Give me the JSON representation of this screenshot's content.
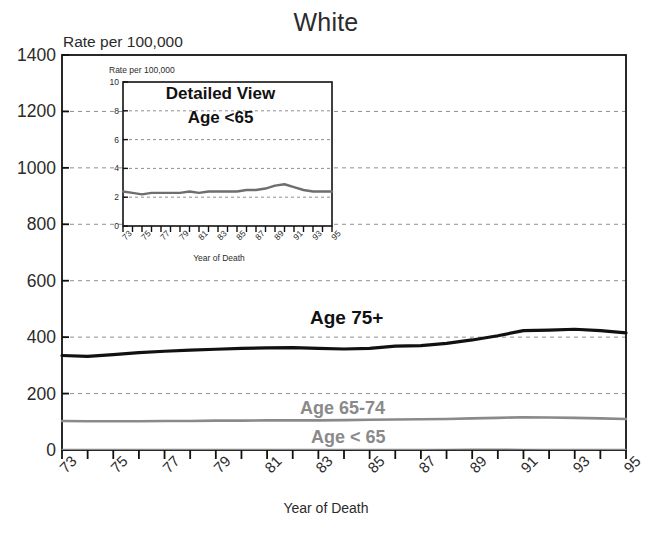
{
  "chart_data": {
    "type": "line",
    "title": "White",
    "ylabel": "Rate per 100,000",
    "xlabel": "Year of Death",
    "grid": true,
    "legend_position": "inline-annotations",
    "ylim": [
      0,
      1400
    ],
    "yticks": [
      "0",
      "200",
      "400",
      "600",
      "800",
      "1000",
      "1200",
      "1400"
    ],
    "xlim": [
      73,
      95
    ],
    "xticks": [
      "73",
      "75",
      "77",
      "79",
      "81",
      "83",
      "85",
      "87",
      "89",
      "91",
      "93",
      "95"
    ],
    "x": [
      73,
      74,
      75,
      76,
      77,
      78,
      79,
      80,
      81,
      82,
      83,
      84,
      85,
      86,
      87,
      88,
      89,
      90,
      91,
      92,
      93,
      94,
      95
    ],
    "series": [
      {
        "name": "Age 75+",
        "color": "#111111",
        "values": [
          335,
          332,
          338,
          345,
          350,
          354,
          357,
          360,
          362,
          363,
          360,
          358,
          360,
          368,
          370,
          378,
          390,
          405,
          423,
          425,
          428,
          423,
          415
        ]
      },
      {
        "name": "Age 65-74",
        "color": "#8a8a8a",
        "values": [
          103,
          102,
          102,
          102,
          103,
          103,
          104,
          104,
          105,
          105,
          105,
          106,
          107,
          108,
          109,
          110,
          112,
          114,
          116,
          115,
          114,
          112,
          110
        ]
      },
      {
        "name": "Age < 65",
        "color": "#8a8a8a",
        "values": [
          2.4,
          2.3,
          2.2,
          2.3,
          2.3,
          2.3,
          2.3,
          2.4,
          2.3,
          2.4,
          2.4,
          2.4,
          2.4,
          2.5,
          2.5,
          2.6,
          2.8,
          2.9,
          2.7,
          2.5,
          2.4,
          2.4,
          2.4
        ]
      }
    ],
    "annotations": [
      {
        "text": "Age 75+",
        "color": "#111111"
      },
      {
        "text": "Age 65-74",
        "color": "#8a8a8a"
      },
      {
        "text": "Age < 65",
        "color": "#8a8a8a"
      }
    ]
  },
  "inset": {
    "title_line1": "Detailed View",
    "title_line2": "Age  <65",
    "ylabel": "Rate per 100,000",
    "xlabel": "Year of Death",
    "ylim": [
      0,
      10
    ],
    "yticks": [
      "0",
      "2",
      "4",
      "6",
      "8",
      "10"
    ],
    "xticks": [
      "73",
      "75",
      "77",
      "79",
      "81",
      "83",
      "85",
      "87",
      "89",
      "91",
      "93",
      "95"
    ],
    "x": [
      73,
      74,
      75,
      76,
      77,
      78,
      79,
      80,
      81,
      82,
      83,
      84,
      85,
      86,
      87,
      88,
      89,
      90,
      91,
      92,
      93,
      94,
      95
    ],
    "values": [
      2.4,
      2.3,
      2.2,
      2.3,
      2.3,
      2.3,
      2.3,
      2.4,
      2.3,
      2.4,
      2.4,
      2.4,
      2.4,
      2.5,
      2.5,
      2.6,
      2.8,
      2.9,
      2.7,
      2.5,
      2.4,
      2.4,
      2.4
    ],
    "line_color": "#6e6e6e"
  }
}
